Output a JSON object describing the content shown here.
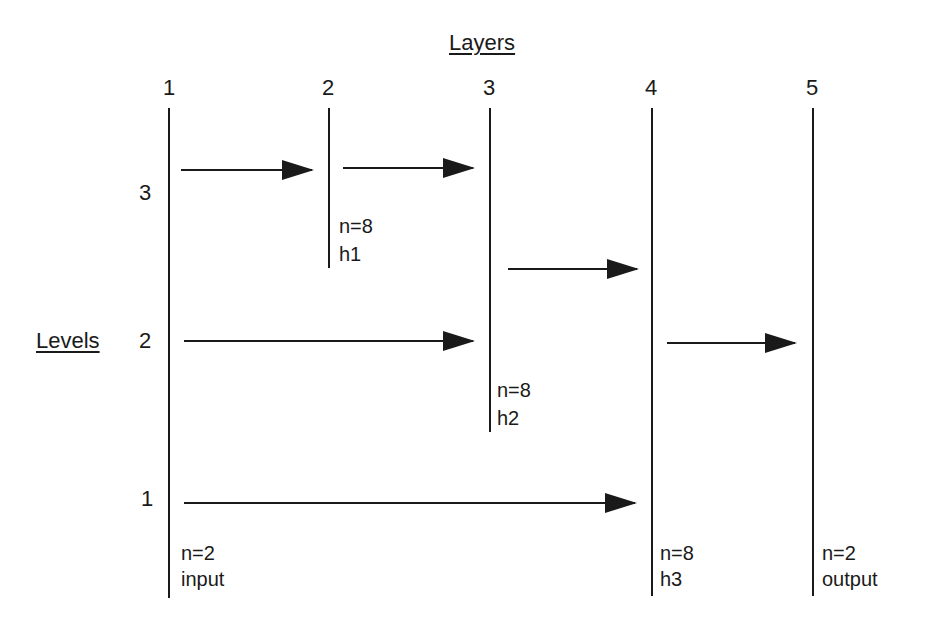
{
  "title": "Layers",
  "axis_label": "Levels",
  "layers": [
    {
      "num": "1",
      "n": "n=2",
      "name": "input"
    },
    {
      "num": "2",
      "n": "n=8",
      "name": "h1"
    },
    {
      "num": "3",
      "n": "n=8",
      "name": "h2"
    },
    {
      "num": "4",
      "n": "n=8",
      "name": "h3"
    },
    {
      "num": "5",
      "n": "n=2",
      "name": "output"
    }
  ],
  "levels": [
    "3",
    "2",
    "1"
  ],
  "connections": [
    {
      "from": "1",
      "to": "2",
      "level": "3"
    },
    {
      "from": "2",
      "to": "3",
      "level": "3"
    },
    {
      "from": "3",
      "to": "4",
      "level": "3"
    },
    {
      "from": "1",
      "to": "3",
      "level": "2"
    },
    {
      "from": "4",
      "to": "5",
      "level": "2"
    },
    {
      "from": "1",
      "to": "4",
      "level": "1"
    }
  ]
}
